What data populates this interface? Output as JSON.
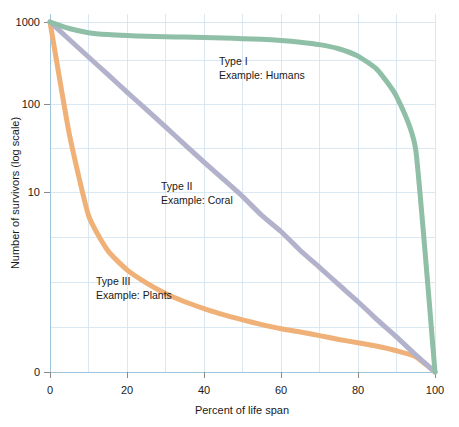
{
  "chart_data": {
    "type": "line",
    "title": "",
    "xlabel": "Percent of life span",
    "ylabel": "Number of survivors (log scale)",
    "yscale": "log",
    "xlim": [
      0,
      100
    ],
    "ylim": [
      1,
      1000
    ],
    "grid": true,
    "legend_position": "inline-annotations",
    "xticks": [
      0,
      20,
      40,
      60,
      80,
      100
    ],
    "xtick_labels": [
      "0",
      "20",
      "40",
      "60",
      "80",
      "100"
    ],
    "yticks": [
      1000,
      100,
      10,
      1
    ],
    "ytick_labels": [
      "1000",
      "100",
      "10",
      "0"
    ],
    "x": [
      0,
      5,
      10,
      15,
      20,
      25,
      30,
      35,
      40,
      45,
      50,
      55,
      60,
      65,
      70,
      75,
      80,
      85,
      90,
      95,
      100
    ],
    "series": [
      {
        "name": "Type I",
        "label": "Type I",
        "example_label": "Example: Humans",
        "example": "Humans",
        "color": "#8fbfa6",
        "values": [
          1000,
          880,
          810,
          780,
          765,
          755,
          748,
          742,
          735,
          728,
          720,
          710,
          695,
          672,
          640,
          590,
          510,
          390,
          230,
          80,
          1
        ]
      },
      {
        "name": "Type II",
        "label": "Type II",
        "example_label": "Example: Coral",
        "example": "Coral",
        "color": "#b3b2cc",
        "values": [
          1000,
          708,
          501,
          355,
          251,
          178,
          126,
          89,
          63,
          45,
          32,
          22,
          16,
          11,
          7.9,
          5.6,
          4.0,
          2.8,
          2.0,
          1.4,
          1
        ]
      },
      {
        "name": "Type III",
        "label": "Type III",
        "example_label": "Example: Plants",
        "example": "Plants",
        "color": "#efb178",
        "values": [
          1000,
          110,
          22,
          11,
          7.5,
          5.8,
          4.7,
          4.0,
          3.5,
          3.1,
          2.8,
          2.55,
          2.35,
          2.2,
          2.05,
          1.9,
          1.78,
          1.66,
          1.52,
          1.35,
          1
        ]
      }
    ],
    "annotations": [
      {
        "id": "type-1",
        "line1": "Type I",
        "line2": "Example: Humans",
        "x_px": 219,
        "y_px": 65
      },
      {
        "id": "type-2",
        "line1": "Type II",
        "line2": "Example: Coral",
        "x_px": 161,
        "y_px": 190
      },
      {
        "id": "type-3",
        "line1": "Type III",
        "line2": "Example: Plants",
        "x_px": 96,
        "y_px": 285
      }
    ],
    "colors": {
      "type_i": "#8fbfa6",
      "type_ii": "#b3b2cc",
      "type_iii": "#efb178",
      "gridline": "#cfe2f0",
      "axis": "#9fc4dd",
      "text": "#1a1a1a",
      "background": "#ffffff"
    }
  }
}
